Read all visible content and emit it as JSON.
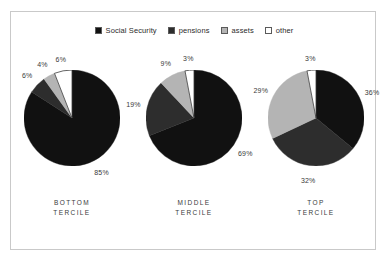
{
  "figure": {
    "background_color": "#ffffff",
    "frame_color": "#c9c9c9"
  },
  "legend": {
    "position": "top-center",
    "items": [
      {
        "label": "Social Security",
        "color": "#111111",
        "swatch_name": "legend-swatch-social-security"
      },
      {
        "label": "pensions",
        "color": "#2d2d2d",
        "swatch_name": "legend-swatch-pensions"
      },
      {
        "label": "assets",
        "color": "#b4b4b4",
        "swatch_name": "legend-swatch-assets"
      },
      {
        "label": "other",
        "color": "#ffffff",
        "swatch_name": "legend-swatch-other"
      }
    ]
  },
  "chart_data": {
    "type": "pie",
    "title": "",
    "subtitle": "",
    "xlabel": "",
    "ylabel": "",
    "grid": false,
    "legend_position": "top-center",
    "series_names": [
      "Social Security",
      "pensions",
      "assets",
      "other"
    ],
    "series_colors": [
      "#111111",
      "#2d2d2d",
      "#b4b4b4",
      "#ffffff"
    ],
    "charts": [
      {
        "category": "BOTTOM TERCILE",
        "caption_line1": "BOTTOM",
        "caption_line2": "TERCILE",
        "slices": [
          {
            "name": "Social Security",
            "value": 85,
            "label": "85%",
            "color": "#111111"
          },
          {
            "name": "pensions",
            "value": 6,
            "label": "6%",
            "color": "#2d2d2d"
          },
          {
            "name": "assets",
            "value": 4,
            "label": "4%",
            "color": "#b4b4b4"
          },
          {
            "name": "other",
            "value": 6,
            "label": "6%",
            "color": "#ffffff"
          }
        ]
      },
      {
        "category": "MIDDLE TERCILE",
        "caption_line1": "MIDDLE",
        "caption_line2": "TERCILE",
        "slices": [
          {
            "name": "Social Security",
            "value": 69,
            "label": "69%",
            "color": "#111111"
          },
          {
            "name": "pensions",
            "value": 19,
            "label": "19%",
            "color": "#2d2d2d"
          },
          {
            "name": "assets",
            "value": 9,
            "label": "9%",
            "color": "#b4b4b4"
          },
          {
            "name": "other",
            "value": 3,
            "label": "3%",
            "color": "#ffffff"
          }
        ]
      },
      {
        "category": "TOP TERCILE",
        "caption_line1": "TOP",
        "caption_line2": "TERCILE",
        "slices": [
          {
            "name": "Social Security",
            "value": 36,
            "label": "36%",
            "color": "#111111"
          },
          {
            "name": "pensions",
            "value": 32,
            "label": "32%",
            "color": "#2d2d2d"
          },
          {
            "name": "assets",
            "value": 29,
            "label": "29%",
            "color": "#b4b4b4"
          },
          {
            "name": "other",
            "value": 3,
            "label": "3%",
            "color": "#ffffff"
          }
        ]
      }
    ]
  }
}
